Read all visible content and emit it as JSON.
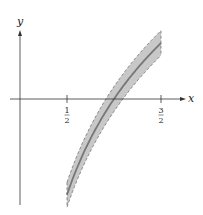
{
  "chart_data": {
    "type": "line",
    "title": "",
    "xlabel": "x",
    "ylabel": "y",
    "x_ticks": [
      {
        "value": 0.5,
        "num": "1",
        "den": "2"
      },
      {
        "value": 1.5,
        "num": "3",
        "den": "2"
      }
    ],
    "series": [
      {
        "name": "curve",
        "function": "ln(x)",
        "x": [
          0.5,
          0.75,
          1.0,
          1.25,
          1.5
        ],
        "values": [
          -0.693,
          -0.288,
          0.0,
          0.223,
          0.405
        ]
      },
      {
        "name": "upper band",
        "style": "dashed",
        "offset": 0.09
      },
      {
        "name": "lower band",
        "style": "dashed",
        "offset": -0.09
      }
    ],
    "band_fill": "#c8c8c8",
    "curve_color": "#777777",
    "axis_color": "#333333",
    "grid": false,
    "legend": "none"
  }
}
